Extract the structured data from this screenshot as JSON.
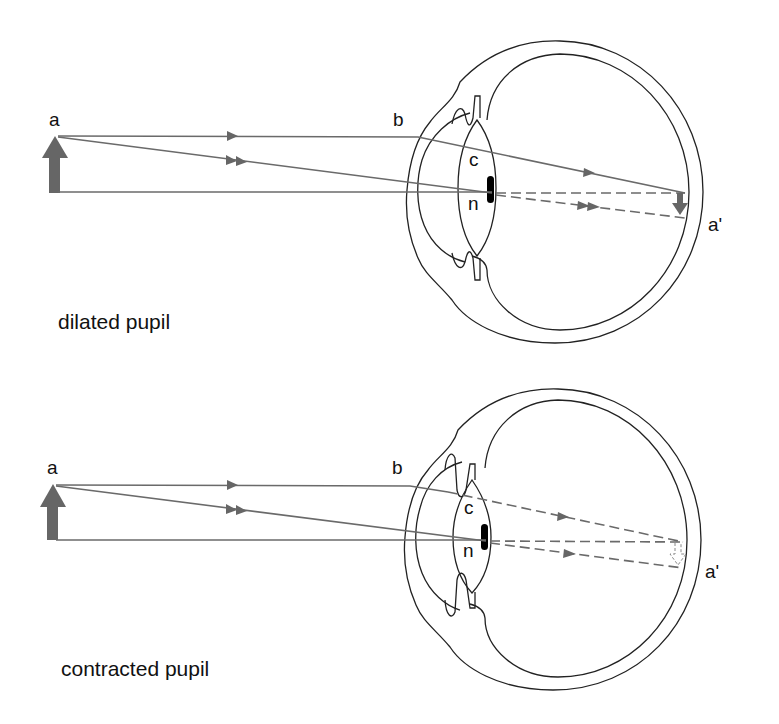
{
  "figure": {
    "panels": [
      {
        "id": "dilated",
        "caption": "dilated pupil",
        "labels": {
          "object": "a",
          "ray_entry": "b",
          "lens_center": "c",
          "nodal_point": "n",
          "image": "a'"
        },
        "rays": {
          "ray1": "solid to retina (parallel ray through lens edge)",
          "ray2": "dashed after lens (ray through nodal point)",
          "axis": "dashed after lens"
        },
        "image_arrow": "inverted, solid"
      },
      {
        "id": "contracted",
        "caption": "contracted pupil",
        "labels": {
          "object": "a",
          "ray_entry": "b",
          "lens_center": "c",
          "nodal_point": "n",
          "image": "a'"
        },
        "rays": {
          "ray1": "dashed after lens (blocked by iris)",
          "ray2": "dashed after lens",
          "axis": "dashed after lens"
        },
        "image_arrow": "inverted, dashed outline"
      }
    ],
    "colors": {
      "ray": "#6a6a6a",
      "outline": "#222222",
      "arrow": "#666666",
      "pupil_mark": "#000000"
    }
  }
}
